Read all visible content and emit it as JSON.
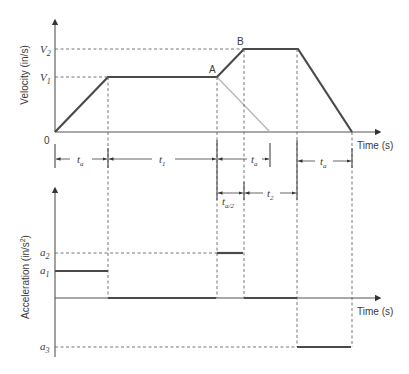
{
  "velocity_chart": {
    "y_label": "Velocity (in/s)",
    "x_label": "Time (s)",
    "origin_label": "0",
    "levels": {
      "v2": "V",
      "v2_sub": "2",
      "v1": "V",
      "v1_sub": "1"
    },
    "points": {
      "a": "A",
      "b": "B"
    },
    "dimensions": {
      "ta_1": "t",
      "ta_1_sub": "a",
      "t1": "t",
      "t1_sub": "1",
      "ta_2": "t",
      "ta_2_sub": "a",
      "ta_3": "t",
      "ta_3_sub": "a",
      "ta_half": "t",
      "ta_half_sub": "a/2",
      "t2": "t",
      "t2_sub": "2"
    }
  },
  "acceleration_chart": {
    "y_label": "Acceleration (in/s",
    "y_label_sup": "2",
    "y_label_end": ")",
    "x_label": "Time (s)",
    "levels": {
      "a2": "a",
      "a2_sub": "2",
      "a1": "a",
      "a1_sub": "1",
      "a3": "a",
      "a3_sub": "3"
    }
  },
  "colors": {
    "profile": "#4a4a4a",
    "alt_profile": "#b5b5b5",
    "guides": "#666666"
  }
}
